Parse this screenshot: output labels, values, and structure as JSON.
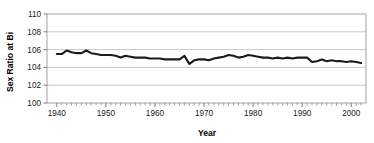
{
  "chart_data": {
    "type": "line",
    "title": "",
    "xlabel": "Year",
    "ylabel": "Sex Ratio at Bi",
    "xlim": [
      1938,
      2003
    ],
    "ylim": [
      100,
      110
    ],
    "ytick_step": 2,
    "xtick_step": 10,
    "xminor_tick_step": 1,
    "grid": "horizontal",
    "legend": "none",
    "line_color": "#1b1b1b",
    "background_color": "#ffffff",
    "gridline_color": "#b9b9b9",
    "frame_color": "#9a9a9a",
    "ytick_labels": [
      "100",
      "102",
      "104",
      "106",
      "108",
      "110"
    ],
    "ytick_values": [
      100,
      102,
      104,
      106,
      108,
      110
    ],
    "xtick_labels": [
      "1940",
      "1950",
      "1960",
      "1970",
      "1980",
      "1990",
      "2000"
    ],
    "xtick_values": [
      1940,
      1950,
      1960,
      1970,
      1980,
      1990,
      2000
    ],
    "series": [
      {
        "name": "Sex Ratio at Birth",
        "x": [
          1940,
          1941,
          1942,
          1943,
          1944,
          1945,
          1946,
          1947,
          1948,
          1949,
          1950,
          1951,
          1952,
          1953,
          1954,
          1955,
          1956,
          1957,
          1958,
          1959,
          1960,
          1961,
          1962,
          1963,
          1964,
          1965,
          1966,
          1967,
          1968,
          1969,
          1970,
          1971,
          1972,
          1973,
          1974,
          1975,
          1976,
          1977,
          1978,
          1979,
          1980,
          1981,
          1982,
          1983,
          1984,
          1985,
          1986,
          1987,
          1988,
          1989,
          1990,
          1991,
          1992,
          1993,
          1994,
          1995,
          1996,
          1997,
          1998,
          1999,
          2000,
          2001,
          2002
        ],
        "values": [
          105.5,
          105.5,
          105.9,
          105.7,
          105.6,
          105.6,
          105.9,
          105.6,
          105.5,
          105.4,
          105.4,
          105.4,
          105.3,
          105.1,
          105.3,
          105.2,
          105.1,
          105.1,
          105.1,
          105.0,
          105.0,
          105.0,
          104.9,
          104.9,
          104.9,
          104.9,
          105.3,
          104.4,
          104.8,
          104.9,
          104.9,
          104.8,
          105.0,
          105.1,
          105.2,
          105.4,
          105.3,
          105.1,
          105.2,
          105.4,
          105.3,
          105.2,
          105.1,
          105.1,
          105.0,
          105.1,
          105.0,
          105.1,
          105.0,
          105.1,
          105.1,
          105.1,
          104.6,
          104.7,
          104.9,
          104.7,
          104.8,
          104.7,
          104.7,
          104.6,
          104.7,
          104.6,
          104.5
        ]
      }
    ]
  }
}
